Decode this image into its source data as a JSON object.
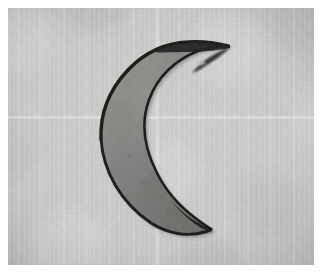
{
  "image": {
    "kind": "photograph",
    "subject_label": "crescent-shaped stone artifact",
    "orientation_label": "crescent opening to the right",
    "alt_text": "Photograph of a dark grey crescent-shaped lithic artifact resting on a pale grey textured card",
    "background_label": "pale grey textured card"
  },
  "colors": {
    "page_margin": "#ffffff",
    "background_light": "#cdcdcb",
    "background_mid": "#c8c8c6",
    "background_dark": "#b8b8b6",
    "specimen_body_light": "#8d8d8a",
    "specimen_body_mid": "#7a7a78",
    "specimen_body_dark": "#6a6a68",
    "specimen_edge": "#1c1c1c",
    "specimen_edge_soft": "#2e2e2c",
    "specimen_highlight": "#b4b4b0",
    "shadow": "#a8a8a5"
  },
  "photo_frame": {
    "left": 8,
    "top": 8,
    "width": 306,
    "height": 257
  },
  "specimen_geometry": {
    "outer_contour_label": "convex left arc of the crescent",
    "inner_contour_label": "concave right arc of the crescent",
    "upper_tip_label": "upper horn tip",
    "lower_tip_label": "lower horn tip",
    "upper_tip_xy": [
      220,
      38
    ],
    "lower_tip_xy": [
      202,
      222
    ],
    "leftmost_xy": [
      93,
      128
    ],
    "inner_apex_xy": [
      152,
      128
    ],
    "outer_path": "M 220 38 C 185 34 150 40 124 62 C 100 82 90 106 93 132 C 96 164 116 194 146 214 C 168 228 190 226 202 222 C 186 216 166 202 152 186 C 134 164 126 140 128 116 C 130 92 142 70 160 56 C 178 42 200 38 220 38 Z",
    "inner_path": "M 218 40 C 196 42 176 50 162 64 C 146 80 138 102 138 124 C 138 150 148 176 164 196 C 176 210 190 218 200 221 C 186 212 170 196 160 178 C 148 156 144 132 148 110 C 152 86 168 64 190 50 C 198 45 208 41 218 40 Z",
    "highlight_path": "M 214 44 C 190 46 170 56 156 72 C 142 88 134 108 134 126"
  },
  "annotations": {
    "has_scale_bar": false,
    "has_text_label": false,
    "has_border": true
  }
}
